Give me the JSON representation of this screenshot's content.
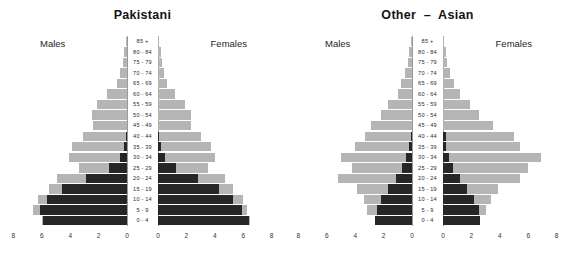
{
  "figure": {
    "shared_age_groups": [
      "85 +",
      "80 - 84",
      "75 - 79",
      "70 - 74",
      "65 - 69",
      "60 - 64",
      "55 - 59",
      "50 - 54",
      "45 - 49",
      "40 - 44",
      "35 - 39",
      "30 - 34",
      "25 - 29",
      "20 - 24",
      "15 - 19",
      "10 - 14",
      "5 - 9",
      "0 - 4"
    ],
    "males_label": "Males",
    "females_label": "Females",
    "xticks": [
      8,
      6,
      4,
      2,
      0
    ],
    "colors": {
      "light_series": "#b5b5b5",
      "dark_series": "#262626",
      "axis": "#9a9a9a",
      "text": "#1a1a1a",
      "background": "#ffffff"
    }
  },
  "chart_data": [
    {
      "type": "bar",
      "subtype": "population-pyramid",
      "title": "Pakistani",
      "xlabel": "",
      "ylabel": "",
      "xlim": [
        0,
        8
      ],
      "xticks": [
        8,
        6,
        4,
        2,
        0
      ],
      "grid": false,
      "legend": "none",
      "categories": [
        "85 +",
        "80 - 84",
        "75 - 79",
        "70 - 74",
        "65 - 69",
        "60 - 64",
        "55 - 59",
        "50 - 54",
        "45 - 49",
        "40 - 44",
        "35 - 39",
        "30 - 34",
        "25 - 29",
        "20 - 24",
        "15 - 19",
        "10 - 14",
        "5 - 9",
        "0 - 4"
      ],
      "series": [
        {
          "name": "Males (total)",
          "side": "left",
          "color": "#b5b5b5",
          "values": [
            0.1,
            0.2,
            0.3,
            0.5,
            0.7,
            1.4,
            2.1,
            2.5,
            2.4,
            3.1,
            3.9,
            4.1,
            3.4,
            4.9,
            5.5,
            6.3,
            6.6,
            6.0
          ]
        },
        {
          "name": "Males (UK born)",
          "side": "left",
          "color": "#262626",
          "values": [
            0.0,
            0.0,
            0.0,
            0.0,
            0.0,
            0.0,
            0.0,
            0.0,
            0.0,
            0.1,
            0.2,
            0.5,
            1.3,
            2.9,
            4.6,
            5.6,
            6.1,
            5.9
          ]
        },
        {
          "name": "Females (total)",
          "side": "right",
          "color": "#b5b5b5",
          "values": [
            0.1,
            0.2,
            0.3,
            0.4,
            0.6,
            1.2,
            1.9,
            2.3,
            2.3,
            3.0,
            3.7,
            4.0,
            3.5,
            4.7,
            5.3,
            6.0,
            6.3,
            6.5
          ]
        },
        {
          "name": "Females (UK born)",
          "side": "right",
          "color": "#262626",
          "values": [
            0.0,
            0.0,
            0.0,
            0.0,
            0.0,
            0.0,
            0.0,
            0.0,
            0.0,
            0.1,
            0.2,
            0.5,
            1.3,
            2.8,
            4.3,
            5.3,
            5.9,
            6.4
          ]
        }
      ]
    },
    {
      "type": "bar",
      "subtype": "population-pyramid",
      "title": "Other  –  Asian",
      "xlabel": "",
      "ylabel": "",
      "xlim": [
        0,
        8
      ],
      "xticks": [
        8,
        6,
        4,
        2,
        0
      ],
      "grid": false,
      "legend": "none",
      "categories": [
        "85 +",
        "80 - 84",
        "75 - 79",
        "70 - 74",
        "65 - 69",
        "60 - 64",
        "55 - 59",
        "50 - 54",
        "45 - 49",
        "40 - 44",
        "35 - 39",
        "30 - 34",
        "25 - 29",
        "20 - 24",
        "15 - 19",
        "10 - 14",
        "5 - 9",
        "0 - 4"
      ],
      "series": [
        {
          "name": "Males (total)",
          "side": "left",
          "color": "#b5b5b5",
          "values": [
            0.1,
            0.2,
            0.3,
            0.5,
            0.8,
            1.0,
            1.7,
            2.2,
            2.9,
            3.3,
            4.0,
            5.0,
            4.2,
            5.2,
            3.9,
            3.4,
            3.2,
            2.6
          ]
        },
        {
          "name": "Males (UK born)",
          "side": "left",
          "color": "#262626",
          "values": [
            0.0,
            0.0,
            0.0,
            0.0,
            0.0,
            0.0,
            0.0,
            0.0,
            0.0,
            0.1,
            0.2,
            0.4,
            0.7,
            1.1,
            1.7,
            2.2,
            2.5,
            2.6
          ]
        },
        {
          "name": "Females (total)",
          "side": "right",
          "color": "#b5b5b5",
          "values": [
            0.1,
            0.2,
            0.3,
            0.5,
            0.8,
            1.2,
            1.9,
            2.5,
            3.5,
            5.0,
            5.4,
            6.9,
            6.0,
            5.4,
            3.9,
            3.4,
            3.0,
            2.6
          ]
        },
        {
          "name": "Females (UK born)",
          "side": "right",
          "color": "#262626",
          "values": [
            0.0,
            0.0,
            0.0,
            0.0,
            0.0,
            0.0,
            0.0,
            0.0,
            0.0,
            0.2,
            0.2,
            0.4,
            0.7,
            1.2,
            1.7,
            2.2,
            2.5,
            2.6
          ]
        }
      ]
    }
  ]
}
